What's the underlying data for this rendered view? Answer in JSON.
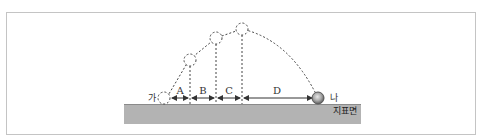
{
  "diagram": {
    "type": "projectile-trajectory",
    "start_label": "가",
    "end_label": "나",
    "ground_label": "지표면",
    "segments": [
      {
        "label": "A"
      },
      {
        "label": "B"
      },
      {
        "label": "C"
      },
      {
        "label": "D"
      }
    ],
    "colors": {
      "ground": "#b3b3b3",
      "ground_edge": "#8a8a8a",
      "line": "#333333",
      "frame": "#c4c4c4",
      "ball_outer": "#6e6e6e",
      "ball_inner": "#d9d9d9"
    }
  }
}
